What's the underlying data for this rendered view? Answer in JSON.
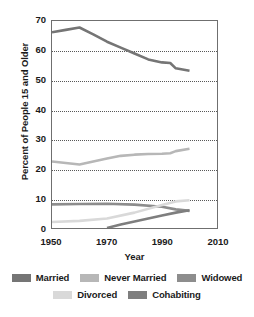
{
  "chart_data": {
    "type": "line",
    "title": "",
    "xlabel": "Year",
    "ylabel": "Percent of People 15 and Older",
    "xlim": [
      1950,
      2010
    ],
    "ylim": [
      0,
      70
    ],
    "xticks": [
      1950,
      1970,
      1990,
      2010
    ],
    "yticks": [
      0,
      10,
      20,
      30,
      40,
      50,
      60,
      70
    ],
    "grid": "horizontal-dotted",
    "legend_position": "bottom",
    "series": [
      {
        "name": "Married",
        "color": "#757575",
        "x": [
          1950,
          1955,
          1960,
          1965,
          1970,
          1975,
          1980,
          1985,
          1990,
          1993,
          1995,
          2000
        ],
        "values": [
          66.2,
          67.0,
          67.8,
          65.5,
          63.0,
          61.0,
          59.0,
          57.0,
          56.0,
          55.8,
          54.0,
          53.2
        ]
      },
      {
        "name": "Never Married",
        "color": "#b7b7b7",
        "x": [
          1950,
          1955,
          1960,
          1965,
          1970,
          1975,
          1980,
          1985,
          1990,
          1993,
          1995,
          2000
        ],
        "values": [
          22.5,
          22.0,
          21.5,
          22.5,
          23.5,
          24.4,
          24.8,
          25.0,
          25.1,
          25.3,
          26.0,
          26.8
        ]
      },
      {
        "name": "Widowed",
        "color": "#8d8d8d",
        "x": [
          1950,
          1960,
          1970,
          1980,
          1990,
          1995,
          2000
        ],
        "values": [
          8.0,
          8.1,
          8.2,
          7.9,
          7.2,
          6.3,
          5.8
        ]
      },
      {
        "name": "Divorced",
        "color": "#d9d9d9",
        "x": [
          1950,
          1960,
          1970,
          1980,
          1990,
          1995,
          2000
        ],
        "values": [
          2.0,
          2.4,
          3.2,
          5.2,
          7.8,
          9.0,
          9.4
        ]
      },
      {
        "name": "Cohabiting",
        "color": "#7e7e7e",
        "x": [
          1970,
          1975,
          1980,
          1985,
          1990,
          1995,
          2000
        ],
        "values": [
          0.0,
          1.2,
          2.2,
          3.2,
          4.2,
          5.2,
          6.0
        ]
      }
    ]
  },
  "axes": {
    "ylabel": "Percent of People 15 and Older",
    "xlabel": "Year",
    "yticks": [
      "70",
      "60",
      "50",
      "40",
      "30",
      "20",
      "10",
      "0"
    ],
    "xticks": [
      "1950",
      "1970",
      "1990",
      "2010"
    ]
  },
  "legend": {
    "row1": [
      {
        "label": "Married",
        "color": "#757575"
      },
      {
        "label": "Never Married",
        "color": "#b7b7b7"
      },
      {
        "label": "Widowed",
        "color": "#8d8d8d"
      }
    ],
    "row2": [
      {
        "label": "Divorced",
        "color": "#d9d9d9"
      },
      {
        "label": "Cohabiting",
        "color": "#7e7e7e"
      }
    ]
  }
}
